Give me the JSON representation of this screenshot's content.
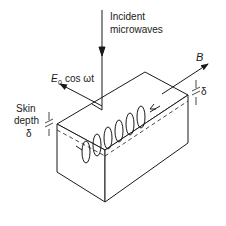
{
  "diagram": {
    "labels": {
      "incident_line1": "Incident",
      "incident_line2": "microwaves",
      "efield_main": "E",
      "efield_sub": "0",
      "efield_rest": "cos ωt",
      "bfield": "B",
      "skin_line1": "Skin",
      "skin_line2": "depth",
      "skin_symbol": "δ",
      "delta_right": "δ"
    },
    "colors": {
      "line": "#1a1a1a",
      "background": "#ffffff"
    }
  }
}
